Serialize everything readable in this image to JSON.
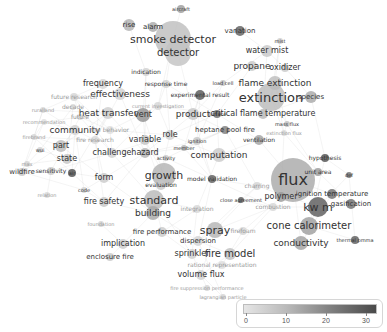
{
  "map": {
    "type": "keyword co-occurrence network",
    "nodes": [
      {
        "label": "smoke detector",
        "x": 173,
        "y": 39,
        "size": 11,
        "bubble": 18,
        "shade": "#bdbdbd"
      },
      {
        "label": "detector",
        "x": 178,
        "y": 53,
        "size": 10,
        "bubble": 13,
        "shade": "#c2c2c2"
      },
      {
        "label": "rise",
        "x": 129,
        "y": 25,
        "size": 7,
        "bubble": 6,
        "shade": "#b0b0b0"
      },
      {
        "label": "alarm",
        "x": 153,
        "y": 27,
        "size": 7,
        "bubble": 5,
        "shade": "#a9a9a9"
      },
      {
        "label": "aircraft",
        "x": 181,
        "y": 9,
        "size": 5,
        "bubble": 4,
        "shade": "#9a9a9a"
      },
      {
        "label": "variation",
        "x": 240,
        "y": 31,
        "size": 7,
        "bubble": 5,
        "shade": "#5c5c5c"
      },
      {
        "label": "mist",
        "x": 280,
        "y": 41,
        "size": 5,
        "bubble": 3,
        "shade": "#cccccc"
      },
      {
        "label": "water mist",
        "x": 267,
        "y": 51,
        "size": 8,
        "bubble": 6,
        "shade": "#c7c7c7"
      },
      {
        "label": "propane",
        "x": 252,
        "y": 66,
        "size": 9,
        "bubble": 5,
        "shade": "#c8c8c8"
      },
      {
        "label": "oxidizer",
        "x": 285,
        "y": 68,
        "size": 8,
        "bubble": 4,
        "shade": "#c8c8c8"
      },
      {
        "label": "indication",
        "x": 146,
        "y": 72,
        "size": 6,
        "bubble": 4,
        "shade": "#cfcfcf"
      },
      {
        "label": "frequency",
        "x": 103,
        "y": 84,
        "size": 8,
        "bubble": 5,
        "shade": "#d5d5d5"
      },
      {
        "label": "response time",
        "x": 166,
        "y": 84,
        "size": 6,
        "bubble": 4,
        "shade": "#d0d0d0"
      },
      {
        "label": "load cell",
        "x": 223,
        "y": 83,
        "size": 5,
        "bubble": 3,
        "shade": "#bebebe"
      },
      {
        "label": "flame extinction",
        "x": 275,
        "y": 83,
        "size": 9,
        "bubble": 7,
        "shade": "#bcbcbc"
      },
      {
        "label": "effectiveness",
        "x": 120,
        "y": 94,
        "size": 9,
        "bubble": 6,
        "shade": "#cfcfcf"
      },
      {
        "label": "future research",
        "x": 74,
        "y": 97,
        "size": 6,
        "bubble": 4,
        "shade": "#d5d5d5"
      },
      {
        "label": "experimental result",
        "x": 200,
        "y": 95,
        "size": 6,
        "bubble": 5,
        "shade": "#555555"
      },
      {
        "label": "extinction",
        "x": 271,
        "y": 97,
        "size": 13,
        "bubble": 14,
        "shade": "#b9b9b9"
      },
      {
        "label": "species",
        "x": 311,
        "y": 97,
        "size": 7,
        "bubble": 6,
        "shade": "#a8a8a8"
      },
      {
        "label": "current investigation",
        "x": 158,
        "y": 106,
        "size": 5,
        "bubble": 4,
        "shade": "#d4d4d4"
      },
      {
        "label": "ruralland",
        "x": 43,
        "y": 110,
        "size": 5,
        "bubble": 3,
        "shade": "#d6d6d6"
      },
      {
        "label": "decade",
        "x": 73,
        "y": 107,
        "size": 6,
        "bubble": 3,
        "shade": "#d6d6d6"
      },
      {
        "label": "heat transfer",
        "x": 108,
        "y": 113,
        "size": 9,
        "bubble": 6,
        "shade": "#cccccc"
      },
      {
        "label": "future",
        "x": 80,
        "y": 117,
        "size": 6,
        "bubble": 3,
        "shade": "#d6d6d6"
      },
      {
        "label": "recommendation",
        "x": 44,
        "y": 122,
        "size": 5,
        "bubble": 3,
        "shade": "#dddddd"
      },
      {
        "label": "vent",
        "x": 143,
        "y": 115,
        "size": 8,
        "bubble": 7,
        "shade": "#8e8e8e"
      },
      {
        "label": "product",
        "x": 193,
        "y": 114,
        "size": 9,
        "bubble": 6,
        "shade": "#c5c5c5"
      },
      {
        "label": "surface",
        "x": 217,
        "y": 114,
        "size": 5,
        "bubble": 4,
        "shade": "#6a6a6a"
      },
      {
        "label": "critical flame temperature",
        "x": 263,
        "y": 114,
        "size": 8,
        "bubble": 5,
        "shade": "#b5b5b5"
      },
      {
        "label": "mass flux",
        "x": 287,
        "y": 124,
        "size": 5,
        "bubble": 3,
        "shade": "#bdbdbd"
      },
      {
        "label": "community",
        "x": 75,
        "y": 130,
        "size": 9,
        "bubble": 5,
        "shade": "#d0d0d0"
      },
      {
        "label": "fire behavior",
        "x": 110,
        "y": 130,
        "size": 6,
        "bubble": 4,
        "shade": "#dedede"
      },
      {
        "label": "heptane pool fire",
        "x": 225,
        "y": 130,
        "size": 7,
        "bubble": 4,
        "shade": "#7a7a7a"
      },
      {
        "label": "extinction flux",
        "x": 284,
        "y": 133,
        "size": 5,
        "bubble": 3,
        "shade": "#d8d8d8"
      },
      {
        "label": "firebrand",
        "x": 34,
        "y": 137,
        "size": 5,
        "bubble": 3,
        "shade": "#d4d4d4"
      },
      {
        "label": "role",
        "x": 170,
        "y": 135,
        "size": 8,
        "bubble": 5,
        "shade": "#cfcfcf"
      },
      {
        "label": "fire research",
        "x": 95,
        "y": 140,
        "size": 6,
        "bubble": 4,
        "shade": "#d8d8d8"
      },
      {
        "label": "variable",
        "x": 145,
        "y": 140,
        "size": 8,
        "bubble": 5,
        "shade": "#c3c3c3"
      },
      {
        "label": "ignition",
        "x": 197,
        "y": 141,
        "size": 5,
        "bubble": 4,
        "shade": "#c6c6c6"
      },
      {
        "label": "ventilation",
        "x": 259,
        "y": 140,
        "size": 6,
        "bubble": 5,
        "shade": "#a0a0a0"
      },
      {
        "label": "part",
        "x": 61,
        "y": 146,
        "size": 8,
        "bubble": 6,
        "shade": "#b9b9b9"
      },
      {
        "label": "wui",
        "x": 40,
        "y": 150,
        "size": 5,
        "bubble": 3,
        "shade": "#d0d0d0"
      },
      {
        "label": "member",
        "x": 184,
        "y": 148,
        "size": 5,
        "bubble": 3,
        "shade": "#b0b0b0"
      },
      {
        "label": "challenge",
        "x": 112,
        "y": 153,
        "size": 8,
        "bubble": 5,
        "shade": "#d0d0d0"
      },
      {
        "label": "hazard",
        "x": 145,
        "y": 153,
        "size": 8,
        "bubble": 5,
        "shade": "#b1b1b1"
      },
      {
        "label": "state",
        "x": 67,
        "y": 159,
        "size": 8,
        "bubble": 5,
        "shade": "#c4c4c4"
      },
      {
        "label": "activity",
        "x": 166,
        "y": 158,
        "size": 5,
        "bubble": 3,
        "shade": "#c5c5c5"
      },
      {
        "label": "computation",
        "x": 219,
        "y": 155,
        "size": 9,
        "bubble": 7,
        "shade": "#c9c9c9"
      },
      {
        "label": "hypothesis",
        "x": 325,
        "y": 158,
        "size": 6,
        "bubble": 4,
        "shade": "#4d4d4d"
      },
      {
        "label": "max",
        "x": 27,
        "y": 164,
        "size": 5,
        "bubble": 3,
        "shade": "#d2d2d2"
      },
      {
        "label": "wildfire",
        "x": 22,
        "y": 172,
        "size": 7,
        "bubble": 4,
        "shade": "#c4c4c4"
      },
      {
        "label": "sensitivity",
        "x": 51,
        "y": 171,
        "size": 6,
        "bubble": 4,
        "shade": "#c8c8c8"
      },
      {
        "label": "air",
        "x": 72,
        "y": 173,
        "size": 5,
        "bubble": 4,
        "shade": "#4b4b4b"
      },
      {
        "label": "unit area",
        "x": 318,
        "y": 172,
        "size": 6,
        "bubble": 4,
        "shade": "#989898"
      },
      {
        "label": "def",
        "x": 349,
        "y": 175,
        "size": 5,
        "bubble": 3,
        "shade": "#6d6d6d"
      },
      {
        "label": "flux",
        "x": 293,
        "y": 180,
        "size": 16,
        "bubble": 22,
        "shade": "#a8a8a8"
      },
      {
        "label": "model validation",
        "x": 212,
        "y": 179,
        "size": 6,
        "bubble": 4,
        "shade": "#5a5a5a"
      },
      {
        "label": "growth",
        "x": 164,
        "y": 175,
        "size": 11,
        "bubble": 12,
        "shade": "#b1b1b1"
      },
      {
        "label": "form",
        "x": 104,
        "y": 178,
        "size": 8,
        "bubble": 5,
        "shade": "#c9c9c9"
      },
      {
        "label": "relation",
        "x": 47,
        "y": 195,
        "size": 5,
        "bubble": 3,
        "shade": "#d7d7d7"
      },
      {
        "label": "code",
        "x": 84,
        "y": 190,
        "size": 5,
        "bubble": 3,
        "shade": "#cfcfcf"
      },
      {
        "label": "evaluation",
        "x": 161,
        "y": 185,
        "size": 6,
        "bubble": 5,
        "shade": "#c6c6c6"
      },
      {
        "label": "charring",
        "x": 257,
        "y": 186,
        "size": 6,
        "bubble": 4,
        "shade": "#d4d4d4"
      },
      {
        "label": "ignition temperature",
        "x": 332,
        "y": 194,
        "size": 7,
        "bubble": 5,
        "shade": "#6c6c6c"
      },
      {
        "label": "close agreement",
        "x": 241,
        "y": 200,
        "size": 5,
        "bubble": 3,
        "shade": "#555555"
      },
      {
        "label": "polymer",
        "x": 281,
        "y": 197,
        "size": 8,
        "bubble": 5,
        "shade": "#9a9a9a"
      },
      {
        "label": "fire safety",
        "x": 104,
        "y": 202,
        "size": 8,
        "bubble": 5,
        "shade": "#c6c6c6"
      },
      {
        "label": "standard",
        "x": 154,
        "y": 200,
        "size": 11,
        "bubble": 10,
        "shade": "#b8b8b8"
      },
      {
        "label": "kw m",
        "x": 318,
        "y": 207,
        "size": 11,
        "bubble": 10,
        "shade": "#585858"
      },
      {
        "label": "gasification",
        "x": 351,
        "y": 204,
        "size": 7,
        "bubble": 5,
        "shade": "#6b6b6b"
      },
      {
        "label": "combustion",
        "x": 273,
        "y": 207,
        "size": 6,
        "bubble": 4,
        "shade": "#d6d6d6"
      },
      {
        "label": "integration",
        "x": 197,
        "y": 209,
        "size": 6,
        "bubble": 4,
        "shade": "#d6d6d6"
      },
      {
        "label": "building",
        "x": 153,
        "y": 213,
        "size": 9,
        "bubble": 7,
        "shade": "#a6a6a6"
      },
      {
        "label": "foundation",
        "x": 101,
        "y": 224,
        "size": 5,
        "bubble": 3,
        "shade": "#d2d2d2"
      },
      {
        "label": "cone calorimeter",
        "x": 309,
        "y": 226,
        "size": 10,
        "bubble": 9,
        "shade": "#9c9c9c"
      },
      {
        "label": "fire performance",
        "x": 162,
        "y": 232,
        "size": 7,
        "bubble": 5,
        "shade": "#c9c9c9"
      },
      {
        "label": "spray",
        "x": 215,
        "y": 230,
        "size": 11,
        "bubble": 8,
        "shade": "#b3b3b3"
      },
      {
        "label": "firefoam",
        "x": 243,
        "y": 231,
        "size": 6,
        "bubble": 4,
        "shade": "#d4d4d4"
      },
      {
        "label": "dispersion",
        "x": 198,
        "y": 241,
        "size": 7,
        "bubble": 5,
        "shade": "#d3d3d3"
      },
      {
        "label": "conductivity",
        "x": 301,
        "y": 243,
        "size": 9,
        "bubble": 7,
        "shade": "#9f9f9f"
      },
      {
        "label": "thermal pmma",
        "x": 355,
        "y": 240,
        "size": 5,
        "bubble": 4,
        "shade": "#5a5a5a"
      },
      {
        "label": "implication",
        "x": 123,
        "y": 244,
        "size": 8,
        "bubble": 5,
        "shade": "#c9c9c9"
      },
      {
        "label": "enclosure fire",
        "x": 110,
        "y": 257,
        "size": 7,
        "bubble": 4,
        "shade": "#c8c8c8"
      },
      {
        "label": "sprinkler",
        "x": 192,
        "y": 254,
        "size": 8,
        "bubble": 5,
        "shade": "#cdcdcd"
      },
      {
        "label": "fire model",
        "x": 230,
        "y": 254,
        "size": 10,
        "bubble": 6,
        "shade": "#bebebe"
      },
      {
        "label": "rational representation",
        "x": 222,
        "y": 265,
        "size": 6,
        "bubble": 4,
        "shade": "#dcdcdc"
      },
      {
        "label": "volume flux",
        "x": 201,
        "y": 275,
        "size": 8,
        "bubble": 5,
        "shade": "#cfcfcf"
      },
      {
        "label": "fire suppression performance",
        "x": 207,
        "y": 288,
        "size": 5,
        "bubble": 3,
        "shade": "#d2d2d2"
      },
      {
        "label": "lagrangian particle",
        "x": 223,
        "y": 297,
        "size": 5,
        "bubble": 3,
        "shade": "#d2d2d2"
      }
    ]
  },
  "legend": {
    "ticks": [
      "0",
      "10",
      "20",
      "30"
    ],
    "min": 0,
    "max": 32
  }
}
